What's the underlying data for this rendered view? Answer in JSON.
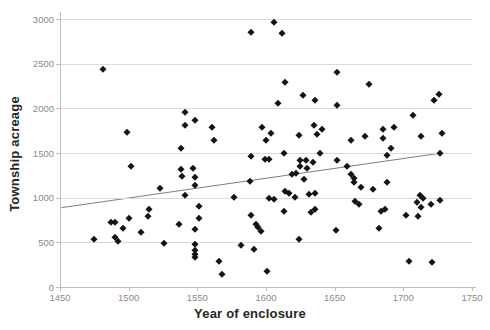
{
  "chart_data": {
    "type": "scatter",
    "title": "",
    "xlabel": "Year of enclosure",
    "ylabel": "Township acreage",
    "xlim": [
      1450,
      1750
    ],
    "ylim": [
      0,
      3000
    ],
    "x_ticks": [
      1450,
      1500,
      1550,
      1600,
      1650,
      1700,
      1750
    ],
    "y_ticks": [
      0,
      500,
      1000,
      1500,
      2000,
      2500,
      3000
    ],
    "grid": "horizontal-only",
    "legend": "none",
    "marker_shape": "diamond",
    "marker_color": "#141414",
    "gridline_color": "#d9d9d9",
    "axis_color": "#bfbfbf",
    "tick_label_color": "#8a8a8a",
    "axis_title_color": "#262626",
    "trendline": {
      "type": "linear",
      "color": "#7f7f7f",
      "x1": 1451,
      "y1": 888,
      "x2": 1728,
      "y2": 1500
    },
    "points": [
      [
        1606,
        2970
      ],
      [
        1589,
        2855
      ],
      [
        1612,
        2845
      ],
      [
        1481,
        2435
      ],
      [
        1652,
        2410
      ],
      [
        1614,
        2290
      ],
      [
        1675,
        2275
      ],
      [
        1627,
        2145
      ],
      [
        1726,
        2165
      ],
      [
        1722,
        2090
      ],
      [
        1636,
        2095
      ],
      [
        1609,
        2060
      ],
      [
        1652,
        2040
      ],
      [
        1541,
        1960
      ],
      [
        1707,
        1930
      ],
      [
        1548,
        1875
      ],
      [
        1635,
        1815
      ],
      [
        1541,
        1810
      ],
      [
        1561,
        1795
      ],
      [
        1597,
        1790
      ],
      [
        1685,
        1770
      ],
      [
        1641,
        1770
      ],
      [
        1499,
        1735
      ],
      [
        1728,
        1720
      ],
      [
        1693,
        1795
      ],
      [
        1604,
        1725
      ],
      [
        1624,
        1700
      ],
      [
        1637,
        1710
      ],
      [
        1672,
        1695
      ],
      [
        1713,
        1685
      ],
      [
        1685,
        1670
      ],
      [
        1662,
        1650
      ],
      [
        1562,
        1650
      ],
      [
        1600,
        1640
      ],
      [
        1691,
        1560
      ],
      [
        1538,
        1560
      ],
      [
        1613,
        1500
      ],
      [
        1639,
        1505
      ],
      [
        1727,
        1505
      ],
      [
        1589,
        1470
      ],
      [
        1688,
        1475
      ],
      [
        1599,
        1430
      ],
      [
        1602,
        1430
      ],
      [
        1629,
        1425
      ],
      [
        1625,
        1420
      ],
      [
        1502,
        1360
      ],
      [
        1634,
        1400
      ],
      [
        1625,
        1355
      ],
      [
        1630,
        1335
      ],
      [
        1622,
        1280
      ],
      [
        1619,
        1260
      ],
      [
        1628,
        1210
      ],
      [
        1659,
        1350
      ],
      [
        1652,
        1425
      ],
      [
        1662,
        1265
      ],
      [
        1664,
        1215
      ],
      [
        1664,
        1175
      ],
      [
        1669,
        1115
      ],
      [
        1678,
        1100
      ],
      [
        1688,
        1180
      ],
      [
        1588,
        1185
      ],
      [
        1523,
        1110
      ],
      [
        1538,
        1320
      ],
      [
        1547,
        1330
      ],
      [
        1539,
        1245
      ],
      [
        1548,
        1230
      ],
      [
        1548,
        1145
      ],
      [
        1541,
        1030
      ],
      [
        1577,
        1010
      ],
      [
        1602,
        995
      ],
      [
        1606,
        980
      ],
      [
        1614,
        1080
      ],
      [
        1617,
        1055
      ],
      [
        1621,
        1010
      ],
      [
        1631,
        1040
      ],
      [
        1636,
        1055
      ],
      [
        1665,
        960
      ],
      [
        1668,
        925
      ],
      [
        1712,
        1025
      ],
      [
        1714,
        995
      ],
      [
        1710,
        955
      ],
      [
        1727,
        970
      ],
      [
        1720,
        930
      ],
      [
        1713,
        890
      ],
      [
        1684,
        850
      ],
      [
        1687,
        870
      ],
      [
        1613,
        855
      ],
      [
        1633,
        835
      ],
      [
        1636,
        870
      ],
      [
        1589,
        805
      ],
      [
        1702,
        810
      ],
      [
        1711,
        790
      ],
      [
        1551,
        905
      ],
      [
        1551,
        775
      ],
      [
        1515,
        870
      ],
      [
        1514,
        800
      ],
      [
        1500,
        770
      ],
      [
        1487,
        730
      ],
      [
        1490,
        730
      ],
      [
        1496,
        665
      ],
      [
        1537,
        705
      ],
      [
        1593,
        710
      ],
      [
        1594,
        670
      ],
      [
        1596,
        630
      ],
      [
        1509,
        620
      ],
      [
        1548,
        645
      ],
      [
        1651,
        635
      ],
      [
        1682,
        655
      ],
      [
        1624,
        535
      ],
      [
        1475,
        540
      ],
      [
        1490,
        560
      ],
      [
        1492,
        515
      ],
      [
        1526,
        490
      ],
      [
        1548,
        480
      ],
      [
        1548,
        410
      ],
      [
        1548,
        370
      ],
      [
        1548,
        340
      ],
      [
        1582,
        465
      ],
      [
        1591,
        430
      ],
      [
        1566,
        295
      ],
      [
        1704,
        290
      ],
      [
        1721,
        275
      ],
      [
        1601,
        175
      ],
      [
        1568,
        140
      ]
    ]
  }
}
